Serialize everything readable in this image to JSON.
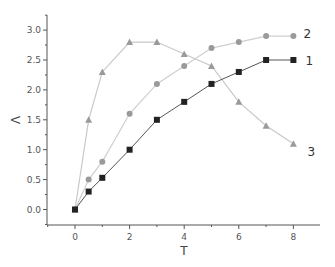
{
  "chart_data": {
    "type": "line",
    "title": "",
    "xlabel": "T",
    "ylabel": "Λ",
    "xlim": [
      -0.9,
      9.1
    ],
    "ylim": [
      -0.25,
      3.25
    ],
    "xticks": [
      0,
      2,
      4,
      6,
      8
    ],
    "yticks": [
      0.0,
      0.5,
      1.0,
      1.5,
      2.0,
      2.5,
      3.0
    ],
    "ytick_labels": [
      "0.0",
      "0.5",
      "1.0",
      "1.5",
      "2.0",
      "2.5",
      "3.0"
    ],
    "grid": false,
    "legend": "inline end labels",
    "x": [
      0,
      0.5,
      1,
      2,
      3,
      4,
      5,
      6,
      7,
      8
    ],
    "series": [
      {
        "name": "1",
        "marker": "square",
        "color": "#222222",
        "line_color": "#555555",
        "values": [
          0,
          0.3,
          0.53,
          1.0,
          1.5,
          1.8,
          2.1,
          2.3,
          2.5,
          2.5
        ]
      },
      {
        "name": "2",
        "marker": "circle",
        "color": "#9a9a9a",
        "line_color": "#cfcfcf",
        "values": [
          0,
          0.5,
          0.8,
          1.6,
          2.1,
          2.4,
          2.7,
          2.8,
          2.9,
          2.9
        ]
      },
      {
        "name": "3",
        "marker": "triangle",
        "color": "#9a9a9a",
        "line_color": "#c8c8c8",
        "values": [
          0,
          1.5,
          2.3,
          2.8,
          2.8,
          2.6,
          2.4,
          1.8,
          1.4,
          1.1
        ]
      }
    ]
  }
}
